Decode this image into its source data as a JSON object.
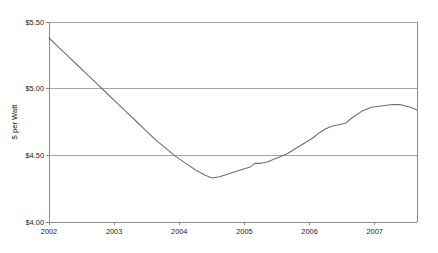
{
  "chart_data": {
    "type": "line",
    "title": "",
    "subtitle": "",
    "xlabel": "",
    "ylabel": "$ per Watt",
    "xlim": [
      2002.0,
      2007.65
    ],
    "ylim": [
      4.0,
      5.5
    ],
    "grid": true,
    "legend": null,
    "x_ticks": [
      "2002",
      "2003",
      "2004",
      "2005",
      "2006",
      "2007"
    ],
    "x_tick_values": [
      2002,
      2003,
      2004,
      2005,
      2006,
      2007
    ],
    "y_ticks": [
      "$4.00",
      "$4.50",
      "$5.00",
      "$5.50"
    ],
    "y_tick_values": [
      4.0,
      4.5,
      5.0,
      5.5
    ],
    "series": [
      {
        "name": "$ per Watt",
        "color": "#6e6e6e",
        "x": [
          2002.0,
          2002.15,
          2002.3,
          2002.45,
          2002.6,
          2002.75,
          2002.9,
          2003.05,
          2003.2,
          2003.35,
          2003.5,
          2003.65,
          2003.8,
          2003.95,
          2004.1,
          2004.25,
          2004.4,
          2004.5,
          2004.62,
          2004.75,
          2004.88,
          2005.0,
          2005.08,
          2005.16,
          2005.25,
          2005.35,
          2005.45,
          2005.55,
          2005.65,
          2005.75,
          2005.85,
          2005.95,
          2006.05,
          2006.15,
          2006.25,
          2006.35,
          2006.45,
          2006.55,
          2006.65,
          2006.8,
          2006.95,
          2007.1,
          2007.25,
          2007.4,
          2007.55,
          2007.65
        ],
        "y": [
          5.38,
          5.31,
          5.24,
          5.17,
          5.1,
          5.03,
          4.96,
          4.89,
          4.82,
          4.75,
          4.68,
          4.61,
          4.55,
          4.49,
          4.44,
          4.39,
          4.35,
          4.33,
          4.34,
          4.36,
          4.38,
          4.4,
          4.41,
          4.44,
          4.44,
          4.45,
          4.47,
          4.49,
          4.51,
          4.54,
          4.57,
          4.6,
          4.63,
          4.67,
          4.7,
          4.72,
          4.73,
          4.74,
          4.78,
          4.83,
          4.86,
          4.87,
          4.88,
          4.88,
          4.86,
          4.84
        ]
      }
    ],
    "annotations": []
  }
}
